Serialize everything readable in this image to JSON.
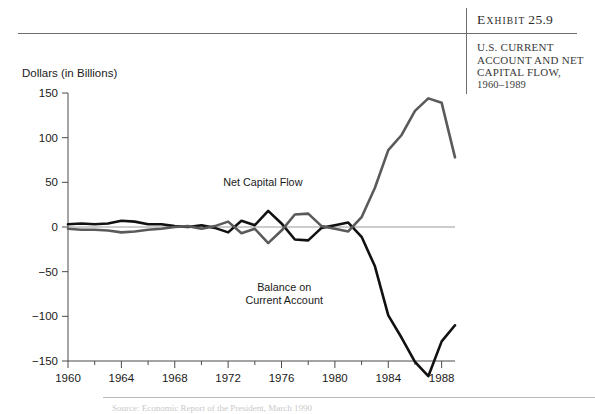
{
  "exhibit": {
    "label_e": "E",
    "label_xhibit": "XHIBIT",
    "number": "25.9",
    "title_line1": "U.S. CURRENT",
    "title_line2": "ACCOUNT AND NET",
    "title_line3": "CAPITAL FLOW,",
    "years": "1960–1989"
  },
  "colors": {
    "net_capital_flow": "#5a5a5a",
    "balance_current_account": "#111111",
    "axis": "#4a4a4a",
    "zero_line": "#9a9a9a",
    "rule": "#6d6d6d"
  },
  "footer": {
    "note": "Source: Economic Report of the President, March 1990"
  },
  "chart_data": {
    "type": "line",
    "xlabel": "",
    "ylabel": "Dollars (in Billions)",
    "ylim": [
      -150,
      150
    ],
    "xlim": [
      1960,
      1989
    ],
    "grid": false,
    "legend": "inline-annotations",
    "ytick_labels": [
      "150",
      "100",
      "50",
      "0",
      "−50",
      "−100",
      "−150"
    ],
    "ytick_values": [
      150,
      100,
      50,
      0,
      -50,
      -100,
      -150
    ],
    "xtick_labels": [
      "1960",
      "1964",
      "1968",
      "1972",
      "1976",
      "1980",
      "1984",
      "1988"
    ],
    "xtick_values": [
      1960,
      1964,
      1968,
      1972,
      1976,
      1980,
      1984,
      1988
    ],
    "x": [
      1960,
      1961,
      1962,
      1963,
      1964,
      1965,
      1966,
      1967,
      1968,
      1969,
      1970,
      1971,
      1972,
      1973,
      1974,
      1975,
      1976,
      1977,
      1978,
      1979,
      1980,
      1981,
      1982,
      1983,
      1984,
      1985,
      1986,
      1987,
      1988,
      1989
    ],
    "series": [
      {
        "name": "Balance on Current Account",
        "color": "#111111",
        "label_x": 1976.2,
        "label_y": -72,
        "values": [
          3,
          4,
          3,
          4,
          7,
          6,
          3,
          3,
          1,
          0,
          2,
          -1,
          -6,
          7,
          2,
          18,
          4,
          -14,
          -15,
          -1,
          2,
          5,
          -11,
          -44,
          -99,
          -124,
          -151,
          -167,
          -128,
          -110
        ]
      },
      {
        "name": "Net Capital Flow",
        "color": "#5a5a5a",
        "label_x": 1974.6,
        "label_y": 46,
        "values": [
          -2,
          -3,
          -3,
          -4,
          -6,
          -5,
          -3,
          -2,
          0,
          1,
          -2,
          1,
          6,
          -7,
          -2,
          -18,
          -4,
          14,
          15,
          1,
          -2,
          -5,
          11,
          44,
          86,
          103,
          130,
          144,
          139,
          78
        ]
      }
    ]
  }
}
